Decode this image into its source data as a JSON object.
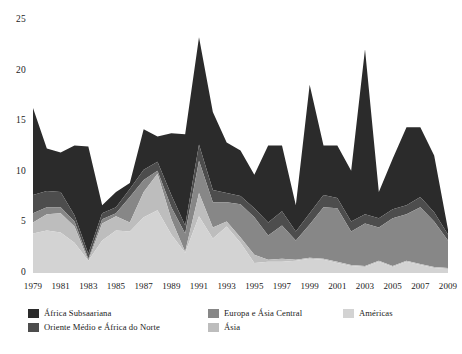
{
  "chart_data": {
    "type": "area",
    "stacked": true,
    "title": "",
    "subtitle": "",
    "xlabel": "",
    "ylabel": "",
    "grid": false,
    "legend_position": "bottom",
    "ylim": [
      0,
      25
    ],
    "yticks": [
      0,
      5,
      10,
      15,
      20,
      25
    ],
    "ytick_labels": [
      "0",
      "5",
      "10",
      "15",
      "20",
      "25"
    ],
    "xlim": [
      1979,
      2009
    ],
    "xticks": [
      1979,
      1981,
      1983,
      1985,
      1987,
      1989,
      1991,
      1993,
      1995,
      1997,
      1999,
      2001,
      2003,
      2005,
      2007,
      2009
    ],
    "xtick_labels": [
      "1979",
      "1981",
      "1983",
      "1985",
      "1987",
      "1989",
      "1991",
      "1993",
      "1995",
      "1997",
      "1999",
      "2001",
      "2003",
      "2005",
      "2007",
      "2009"
    ],
    "x": [
      1979,
      1980,
      1981,
      1982,
      1983,
      1984,
      1985,
      1986,
      1987,
      1988,
      1989,
      1990,
      1991,
      1992,
      1993,
      1994,
      1995,
      1996,
      1997,
      1998,
      1999,
      2000,
      2001,
      2002,
      2003,
      2004,
      2005,
      2006,
      2007,
      2008,
      2009
    ],
    "series": [
      {
        "name": "Ásia",
        "color": "#d3d3d3",
        "values": [
          3.9,
          4.2,
          4.0,
          3.0,
          1.2,
          3.2,
          4.2,
          4.1,
          5.5,
          6.2,
          3.8,
          2.0,
          5.6,
          3.4,
          4.6,
          3.0,
          1.0,
          1.1,
          1.1,
          1.2,
          1.4,
          1.3,
          1.0,
          0.7,
          0.6,
          1.1,
          0.6,
          1.1,
          0.8,
          0.5,
          0.4
        ]
      },
      {
        "name": "Américas",
        "color": "#bdbdbd",
        "values": [
          1.1,
          1.6,
          1.9,
          1.6,
          0.0,
          1.7,
          1.4,
          0.9,
          2.5,
          3.6,
          1.5,
          0.1,
          2.3,
          1.1,
          0.5,
          0.5,
          0.8,
          0.2,
          0.3,
          0.1,
          0.1,
          0.1,
          0.1,
          0.1,
          0.1,
          0.1,
          0.1,
          0.1,
          0.1,
          0.1,
          0.1
        ]
      },
      {
        "name": "Europa e Ásia Central",
        "color": "#878787",
        "values": [
          0.9,
          0.7,
          0.6,
          0.5,
          0.2,
          0.4,
          0.3,
          2.5,
          1.2,
          0.3,
          1.2,
          1.8,
          3.2,
          2.5,
          1.9,
          3.3,
          3.7,
          2.4,
          3.3,
          1.9,
          3.3,
          5.1,
          5.3,
          3.3,
          4.2,
          3.3,
          4.7,
          4.6,
          5.6,
          4.5,
          2.7
        ]
      },
      {
        "name": "Oriente Médio e África do Norte",
        "color": "#4d4d4d",
        "values": [
          1.8,
          1.6,
          1.5,
          0.6,
          0.5,
          0.6,
          0.6,
          0.8,
          1.0,
          0.9,
          1.2,
          0.8,
          1.6,
          1.2,
          0.9,
          0.8,
          0.9,
          1.3,
          1.4,
          0.9,
          1.1,
          1.2,
          1.0,
          1.0,
          0.9,
          0.9,
          0.9,
          0.9,
          1.0,
          0.9,
          0.6
        ]
      },
      {
        "name": "África Subsaariana",
        "color": "#2b2b2b",
        "values": [
          8.6,
          4.2,
          3.9,
          6.9,
          10.6,
          0.8,
          1.5,
          0.6,
          4.0,
          2.5,
          6.1,
          9.0,
          10.6,
          7.7,
          5.0,
          4.5,
          3.3,
          7.6,
          6.5,
          2.6,
          12.7,
          4.9,
          5.2,
          5.0,
          16.3,
          2.6,
          5.0,
          7.7,
          6.9,
          5.6,
          0.5
        ]
      }
    ],
    "legend": [
      {
        "label": "África Subsaariana",
        "color": "#2b2b2b"
      },
      {
        "label": "Oriente Médio e África do Norte",
        "color": "#4d4d4d"
      },
      {
        "label": "Europa e Ásia Central",
        "color": "#878787"
      },
      {
        "label": "Ásia",
        "color": "#bdbdbd"
      },
      {
        "label": "Américas",
        "color": "#d3d3d3"
      }
    ]
  }
}
